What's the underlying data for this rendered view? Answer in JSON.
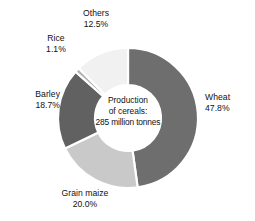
{
  "chart_data": {
    "type": "pie",
    "variant": "donut",
    "title": "",
    "subtitle": "",
    "xlabel": "",
    "ylabel": "",
    "legend_position": "none",
    "grid": false,
    "units": "percent",
    "total_label": {
      "line1": "Production",
      "line2": "of cereals:",
      "line3": "285 million tonnes",
      "total_value": 285,
      "total_units": "million tonnes"
    },
    "categories": [
      "Wheat",
      "Grain maize",
      "Barley",
      "Rice",
      "Others"
    ],
    "values": [
      47.8,
      20.0,
      18.7,
      1.1,
      12.5
    ],
    "slices": [
      {
        "label": "Wheat",
        "value": 47.8,
        "value_text": "47.8%",
        "color": "#6e6e6e",
        "start_deg": 0.0,
        "end_deg": 172.08,
        "label_align": "left"
      },
      {
        "label": "Grain maize",
        "value": 20.0,
        "value_text": "20.0%",
        "color": "#c9c9c9",
        "start_deg": 172.08,
        "end_deg": 244.08,
        "label_align": "center"
      },
      {
        "label": "Barley",
        "value": 18.7,
        "value_text": "18.7%",
        "color": "#616161",
        "start_deg": 244.08,
        "end_deg": 311.4,
        "label_align": "right"
      },
      {
        "label": "Rice",
        "value": 1.1,
        "value_text": "1.1%",
        "color": "#b4b4b4",
        "start_deg": 311.4,
        "end_deg": 315.36,
        "label_align": "center"
      },
      {
        "label": "Others",
        "value": 12.5,
        "value_text": "12.5%",
        "color": "#f1f1f1",
        "start_deg": 315.36,
        "end_deg": 360.0,
        "label_align": "center"
      }
    ],
    "geometry": {
      "center_x": 128,
      "center_y": 118,
      "outer_radius": 70,
      "inner_radius": 33,
      "start_angle_deg": 0,
      "direction": "clockwise",
      "slice_gap_color": "#ffffff"
    },
    "background_color": "#ffffff",
    "text_color": "#111111"
  }
}
